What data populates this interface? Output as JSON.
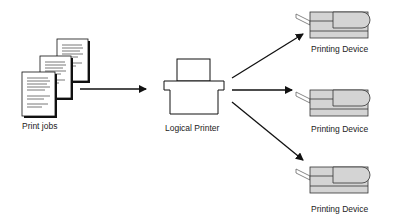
{
  "diagram": {
    "source": {
      "label": "Print jobs",
      "document_count": 3
    },
    "logical_printer": {
      "label": "Logical Printer"
    },
    "devices": [
      {
        "label": "Printing Device"
      },
      {
        "label": "Printing Device"
      },
      {
        "label": "Printing Device"
      }
    ],
    "colors": {
      "device_fill": "#d4d4d4",
      "stroke": "#111111",
      "paper": "#ffffff"
    }
  }
}
